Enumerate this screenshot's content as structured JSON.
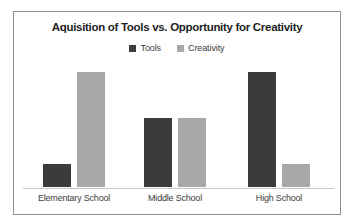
{
  "chart_data": {
    "type": "bar",
    "title": "Aquisition of Tools vs. Opportunity for Creativity",
    "categories": [
      "Elementary School",
      "Middle School",
      "High School"
    ],
    "series": [
      {
        "name": "Tools",
        "color": "#3b3b3b",
        "values": [
          1,
          3,
          5
        ]
      },
      {
        "name": "Creativity",
        "color": "#a8a8a8",
        "values": [
          5,
          3,
          1
        ]
      }
    ],
    "xlabel": "",
    "ylabel": "",
    "ylim": [
      0,
      5.5
    ],
    "grid": false,
    "legend_position": "top",
    "axis_line_color": "#c8c8c8",
    "frame_border_color": "#8f8f8f",
    "background_color": "#ffffff"
  }
}
